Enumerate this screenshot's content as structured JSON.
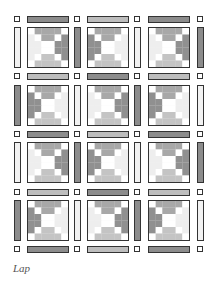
{
  "caption": "Lap",
  "colors": {
    "dark": "#8c8c8c",
    "light": "#bdbdbd",
    "white": "#f2f2f2",
    "outline": "#333333",
    "block_mid": "#a8a8a8",
    "block_dark": "#909090",
    "block_light": "#c4c4c4"
  },
  "layout": {
    "cols_x": [
      14,
      74,
      134,
      197
    ],
    "block_x": [
      27,
      87,
      148
    ],
    "block_w": 42,
    "rows_y": [
      16,
      73,
      131,
      189,
      246
    ],
    "block_y": [
      27,
      85,
      142,
      200
    ],
    "block_h": 41
  },
  "horizontal_sashing": [
    [
      "dark",
      "light",
      "dark"
    ],
    [
      "light",
      "dark",
      "light"
    ],
    [
      "dark",
      "light",
      "dark"
    ],
    [
      "light",
      "dark",
      "light"
    ],
    [
      "dark",
      "light",
      "dark"
    ]
  ],
  "vertical_sashing": [
    [
      "white",
      "dark",
      "white",
      "dark"
    ],
    [
      "dark",
      "white",
      "dark",
      "white"
    ],
    [
      "white",
      "dark",
      "white",
      "dark"
    ],
    [
      "dark",
      "white",
      "dark",
      "white"
    ]
  ],
  "block_orientation": [
    [
      "a",
      "b",
      "a"
    ],
    [
      "b",
      "a",
      "b"
    ],
    [
      "a",
      "b",
      "a"
    ],
    [
      "b",
      "a",
      "b"
    ]
  ]
}
